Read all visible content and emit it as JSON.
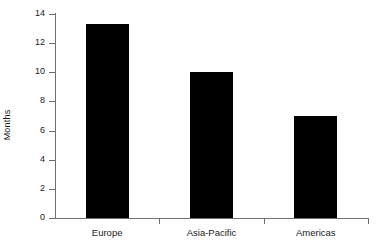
{
  "chart_data": {
    "type": "bar",
    "title": "",
    "xlabel": "",
    "ylabel": "Months",
    "categories": [
      "Europe",
      "Asia-Pacific",
      "Americas"
    ],
    "values": [
      13.3,
      10.0,
      7.0
    ],
    "ylim": [
      0,
      14
    ],
    "yticks": [
      0,
      2,
      4,
      6,
      8,
      10,
      12,
      14
    ],
    "ytick_labels": [
      "0",
      "2",
      "4",
      "6",
      "8",
      "10",
      "12",
      "14"
    ],
    "grid": false,
    "legend": null,
    "bar_color": "#000000",
    "axis_color": "#6f6f6f",
    "background": "#ffffff"
  }
}
